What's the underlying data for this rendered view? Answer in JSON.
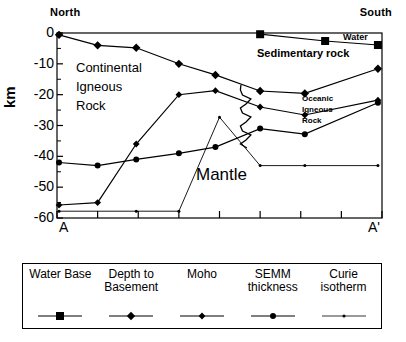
{
  "figure": {
    "direction_left": "North",
    "direction_right": "South",
    "y_axis_label": "km",
    "x_start_label": "A",
    "x_end_label": "A'",
    "annotations": {
      "continental": "Continental\nIgneous\nRock",
      "mantle": "Mantle",
      "sedimentary": "Sedimentary rock",
      "water": "Water",
      "oceanic": "Oceanic\nIgneous\nRock"
    }
  },
  "legend": {
    "items": [
      {
        "label": "Water Base",
        "marker": "square"
      },
      {
        "label": "Depth to\nBasement",
        "marker": "diamond"
      },
      {
        "label": "Moho",
        "marker": "diamond-small"
      },
      {
        "label": "SEMM\nthickness",
        "marker": "circle"
      },
      {
        "label": "Curie\nisotherm",
        "marker": "dot"
      }
    ]
  },
  "chart_data": {
    "type": "line",
    "title": "",
    "xlabel": "",
    "ylabel": "km",
    "xlim": [
      0,
      8
    ],
    "ylim": [
      -60,
      0
    ],
    "yticks": [
      0,
      -10,
      -20,
      -30,
      -40,
      -50,
      -60
    ],
    "ytick_labels": [
      "0",
      "-10",
      "-20",
      "-30",
      "-40",
      "-50",
      "-60"
    ],
    "xticks": [
      0,
      1,
      2,
      3,
      4,
      5,
      6,
      7,
      8
    ],
    "xtick_labels": [
      "A",
      "",
      "",
      "",
      "",
      "",
      "",
      "",
      "A'"
    ],
    "grid": false,
    "legend_position": "below",
    "series": [
      {
        "name": "Water Base",
        "marker": "square",
        "x": [
          5.0,
          6.6,
          7.9
        ],
        "y": [
          -0.4,
          -2.6,
          -3.9
        ]
      },
      {
        "name": "Depth to Basement",
        "marker": "diamond",
        "x": [
          0.05,
          1.0,
          1.95,
          3.0,
          3.9,
          5.0,
          6.1,
          7.9
        ],
        "y": [
          -0.6,
          -4.0,
          -4.8,
          -10.0,
          -13.6,
          -18.8,
          -19.6,
          -11.6
        ]
      },
      {
        "name": "Moho",
        "marker": "diamond-small",
        "x": [
          0.05,
          1.0,
          1.95,
          3.0,
          3.9,
          5.0,
          6.1,
          7.9
        ],
        "y": [
          -55.8,
          -55.0,
          -36.0,
          -20.0,
          -18.7,
          -24.0,
          -26.6,
          -21.8
        ]
      },
      {
        "name": "SEMM thickness",
        "marker": "circle",
        "x": [
          0.05,
          1.0,
          1.95,
          3.0,
          3.9,
          5.0,
          6.1,
          7.9
        ],
        "y": [
          -42.0,
          -43.0,
          -41.0,
          -39.0,
          -37.0,
          -31.0,
          -32.8,
          -22.6
        ]
      },
      {
        "name": "Curie isotherm",
        "marker": "dot",
        "x": [
          0.05,
          1.95,
          3.0,
          4.0,
          5.0,
          6.1,
          7.9
        ],
        "y": [
          -57.8,
          -57.8,
          -57.8,
          -27.3,
          -43.0,
          -43.0,
          -43.0
        ]
      }
    ],
    "boundary_fault": {
      "name": "zigzag-boundary",
      "description": "vertical zigzag fault boundary between continental and oceanic igneous rock",
      "x": 4.6,
      "y_range": [
        -18.5,
        -36.0
      ]
    }
  }
}
